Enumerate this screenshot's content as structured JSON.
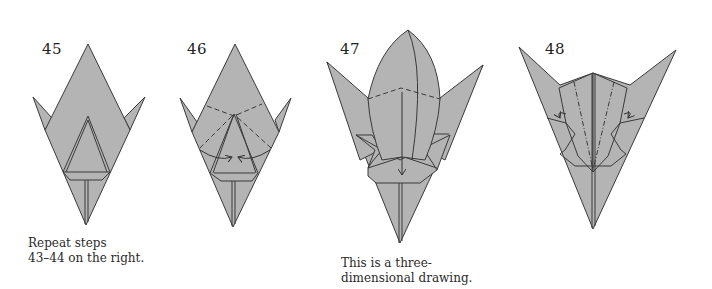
{
  "diagram": {
    "paper_color": "#b4b4b4",
    "line_color": "#3a3a3a",
    "background": "#ffffff",
    "steps": [
      {
        "number": "45",
        "caption": "Repeat steps\n43–44 on the right."
      },
      {
        "number": "46",
        "caption": ""
      },
      {
        "number": "47",
        "caption": "This is a three-\ndimensional drawing."
      },
      {
        "number": "48",
        "caption": ""
      }
    ]
  }
}
